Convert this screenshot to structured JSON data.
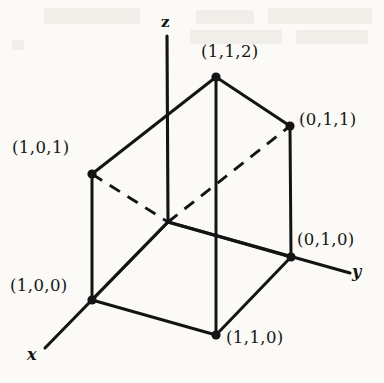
{
  "figure": {
    "kind": "3d-prism-coordinate-diagram",
    "background_color": "#fbfaf7",
    "ink_color": "#141414",
    "axes": [
      {
        "name": "z",
        "label": "z",
        "label_x": 161,
        "label_y": 13,
        "x1": 167,
        "y1": 36,
        "x2": 168,
        "y2": 222
      },
      {
        "name": "x",
        "label": "x",
        "label_x": 27,
        "label_y": 345,
        "x1": 168,
        "y1": 222,
        "x2": 45,
        "y2": 348
      },
      {
        "name": "y",
        "label": "y",
        "label_x": 352,
        "label_y": 262,
        "x1": 168,
        "y1": 222,
        "x2": 350,
        "y2": 273
      }
    ],
    "vertices": [
      {
        "name": "vertex-1-1-2",
        "label": "(1,1,2)",
        "x": 216,
        "y": 77,
        "dot": true,
        "label_x": 201,
        "label_y": 42
      },
      {
        "name": "vertex-0-1-1",
        "label": "(0,1,1)",
        "x": 290,
        "y": 126,
        "dot": true,
        "label_x": 299,
        "label_y": 110
      },
      {
        "name": "vertex-1-0-1",
        "label": "(1,0,1)",
        "x": 92,
        "y": 174,
        "dot": true,
        "label_x": 12,
        "label_y": 138
      },
      {
        "name": "vertex-0-1-0",
        "label": "(0,1,0)",
        "x": 291,
        "y": 257,
        "dot": true,
        "label_x": 297,
        "label_y": 230
      },
      {
        "name": "vertex-1-0-0",
        "label": "(1,0,0)",
        "x": 92,
        "y": 300,
        "dot": true,
        "label_x": 10,
        "label_y": 276
      },
      {
        "name": "vertex-1-1-0",
        "label": "(1,1,0)",
        "x": 216,
        "y": 335,
        "dot": true,
        "label_x": 226,
        "label_y": 328
      },
      {
        "name": "vertex-origin-hidden",
        "label": "",
        "x": 168,
        "y": 222,
        "dot": false,
        "label_x": 0,
        "label_y": 0
      }
    ],
    "solid_edges": [
      {
        "name": "edge-top-left",
        "x1": 216,
        "y1": 77,
        "x2": 92,
        "y2": 174
      },
      {
        "name": "edge-top-right",
        "x1": 216,
        "y1": 77,
        "x2": 290,
        "y2": 126
      },
      {
        "name": "edge-center-vertical",
        "x1": 216,
        "y1": 77,
        "x2": 216,
        "y2": 335
      },
      {
        "name": "edge-left-vertical",
        "x1": 92,
        "y1": 174,
        "x2": 92,
        "y2": 300
      },
      {
        "name": "edge-right-vertical",
        "x1": 290,
        "y1": 126,
        "x2": 291,
        "y2": 257
      },
      {
        "name": "edge-base-front-left",
        "x1": 92,
        "y1": 300,
        "x2": 216,
        "y2": 335
      },
      {
        "name": "edge-base-front-right",
        "x1": 216,
        "y1": 335,
        "x2": 291,
        "y2": 257
      },
      {
        "name": "edge-base-back-left",
        "x1": 92,
        "y1": 300,
        "x2": 168,
        "y2": 222
      },
      {
        "name": "edge-base-back-right",
        "x1": 168,
        "y1": 222,
        "x2": 291,
        "y2": 257
      }
    ],
    "dashed_edges": [
      {
        "name": "hidden-edge-left",
        "x1": 92,
        "y1": 174,
        "x2": 168,
        "y2": 222
      },
      {
        "name": "hidden-edge-right",
        "x1": 168,
        "y1": 222,
        "x2": 290,
        "y2": 126
      }
    ]
  }
}
